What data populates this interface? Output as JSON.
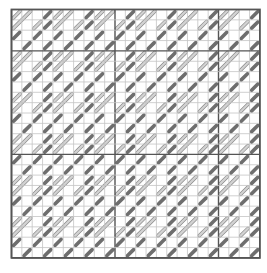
{
  "chart": {
    "origin_x": 11.5,
    "origin_y": 9.5,
    "cell": 10.35,
    "cols": 24,
    "rows": 24,
    "major_every": 10,
    "major_offset_x": 10,
    "major_offset_y": 4,
    "colors": {
      "background": "#ffffff",
      "grid_minor": "#c4c4c4",
      "grid_major": "#555555",
      "frame": "#555555",
      "light_fill": "#d2d2d2",
      "light_stroke": "#8a8a8a",
      "dark_fill": "#6e6e6e",
      "dark_stroke": "#555555"
    },
    "repeat": {
      "rows": 4,
      "cols": 4,
      "stitches": [
        {
          "type": "light-long",
          "row": 0,
          "col": 1
        },
        {
          "type": "light-short",
          "row": 0,
          "col": 0
        },
        {
          "type": "light-short",
          "row": 1,
          "col": 2
        },
        {
          "type": "dark",
          "row": 0,
          "col": 3
        },
        {
          "type": "dark",
          "row": 1,
          "col": 3
        },
        {
          "type": "dark",
          "row": 2,
          "col": 0
        },
        {
          "type": "dark",
          "row": 2,
          "col": 2
        },
        {
          "type": "dark",
          "row": 3,
          "col": 1
        },
        {
          "type": "dark",
          "row": 3,
          "col": 3
        }
      ]
    }
  }
}
